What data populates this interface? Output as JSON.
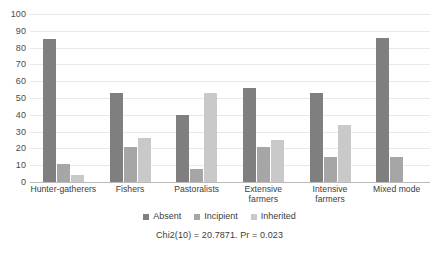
{
  "chart_data": {
    "type": "bar",
    "title": "",
    "subtitle": "",
    "xlabel": "",
    "ylabel": "",
    "ylim": [
      0,
      100
    ],
    "yticks": [
      0,
      10,
      20,
      30,
      40,
      50,
      60,
      70,
      80,
      90,
      100
    ],
    "grid": true,
    "legend_position": "bottom",
    "categories": [
      "Hunter-gatherers",
      "Fishers",
      "Pastoralists",
      "Extensive farmers",
      "Intensive farmers",
      "Mixed mode"
    ],
    "category_lines": [
      [
        "Hunter-gatherers"
      ],
      [
        "Fishers"
      ],
      [
        "Pastoralists"
      ],
      [
        "Extensive",
        "farmers"
      ],
      [
        "Intensive",
        "farmers"
      ],
      [
        "Mixed mode"
      ]
    ],
    "series": [
      {
        "name": "Absent",
        "color": "#7f7f7f",
        "values": [
          85,
          53,
          40,
          56,
          53,
          86
        ]
      },
      {
        "name": "Incipient",
        "color": "#a6a6a6",
        "values": [
          11,
          21,
          8,
          21,
          15,
          15
        ]
      },
      {
        "name": "Inherited",
        "color": "#c9c9c9",
        "values": [
          4,
          26,
          53,
          25,
          34,
          0
        ]
      }
    ],
    "annotation": "Chi2(10) = 20.7871.  Pr = 0.023"
  },
  "legend": {
    "items": [
      {
        "label": "Absent"
      },
      {
        "label": "Incipient"
      },
      {
        "label": "Inherited"
      }
    ]
  }
}
